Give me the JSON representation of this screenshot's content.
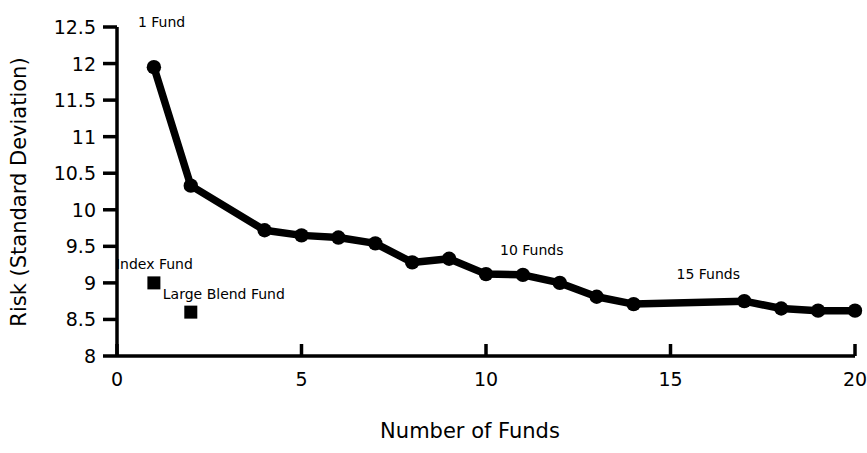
{
  "chart_data": {
    "type": "line",
    "title": "",
    "subtitle": "",
    "xlabel": "Number of Funds",
    "ylabel": "Risk (Standard Deviation)",
    "xlim": [
      0,
      20
    ],
    "ylim": [
      8,
      12.5
    ],
    "grid": false,
    "legend_position": "none",
    "xticks": [
      "0",
      "5",
      "10",
      "15",
      "20"
    ],
    "xtick_values": [
      0,
      5,
      10,
      15,
      20
    ],
    "yticks": [
      "8",
      "8.5",
      "9",
      "9.5",
      "10",
      "10.5",
      "11",
      "11.5",
      "12",
      "12.5"
    ],
    "ytick_values": [
      8,
      8.5,
      9,
      9.5,
      10,
      10.5,
      11,
      11.5,
      12,
      12.5
    ],
    "series": [
      {
        "name": "Portfolio of Funds",
        "marker": "circle",
        "color": "#000000",
        "x": [
          1,
          2,
          4,
          5,
          6,
          7,
          8,
          9,
          10,
          11,
          12,
          13,
          14,
          17,
          18,
          19,
          20
        ],
        "values": [
          11.95,
          10.33,
          9.72,
          9.65,
          9.62,
          9.54,
          9.28,
          9.33,
          9.12,
          9.11,
          9.0,
          8.81,
          8.71,
          8.75,
          8.65,
          8.62,
          8.62
        ]
      },
      {
        "name": "Single Fund Benchmarks",
        "marker": "square",
        "color": "#000000",
        "x": [
          1,
          2
        ],
        "values": [
          9.0,
          8.6
        ]
      }
    ],
    "annotations": [
      {
        "text": "1 Fund",
        "x": 1,
        "y": 12.25,
        "anchor": "start",
        "dx": -16,
        "dy": -18
      },
      {
        "text": "Index Fund",
        "x": 1,
        "y": 9.0,
        "anchor": "start",
        "dx": -38,
        "dy": -14
      },
      {
        "text": "Large Blend Fund",
        "x": 2,
        "y": 8.6,
        "anchor": "start",
        "dx": -28,
        "dy": -13
      },
      {
        "text": "10 Funds",
        "x": 10,
        "y": 9.33,
        "anchor": "start",
        "dx": 14,
        "dy": -4
      },
      {
        "text": "15 Funds",
        "x": 15,
        "y": 9.05,
        "anchor": "start",
        "dx": 6,
        "dy": 0
      }
    ]
  },
  "axes": {
    "x_title": "Number of Funds",
    "y_title": "Risk (Standard Deviation)"
  }
}
